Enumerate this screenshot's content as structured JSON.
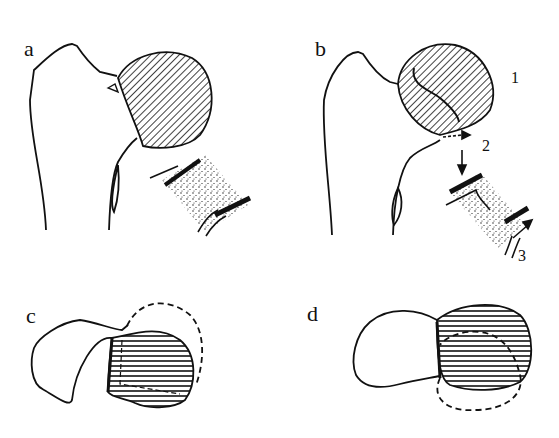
{
  "figure": {
    "panels": [
      {
        "id": "a",
        "label": "a",
        "description": "Femoral head with hatched (diagonal) epiphysis, inset of growth plate"
      },
      {
        "id": "b",
        "label": "b",
        "description": "Femoral head with hatched epiphysis and internal curve, arrows showing displacement, inset of growth plate"
      },
      {
        "id": "c",
        "label": "c",
        "description": "Axial view with horizontally hatched head, dashed outline showing original position"
      },
      {
        "id": "d",
        "label": "d",
        "description": "Axial view with horizontally hatched head, dashed outline showing displaced position"
      }
    ],
    "annotations": [
      {
        "id": "1",
        "label": "1"
      },
      {
        "id": "2",
        "label": "2"
      },
      {
        "id": "3",
        "label": "3"
      }
    ],
    "colors": {
      "line": "#111111",
      "background": "#ffffff"
    }
  }
}
